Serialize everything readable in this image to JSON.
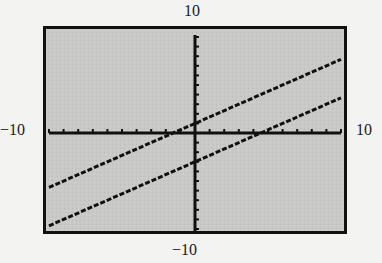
{
  "window": {
    "xmin": -10,
    "xmax": 10,
    "ymin": -10,
    "ymax": 10,
    "xscl": 1,
    "yscl": 1
  },
  "labels": {
    "top": "10",
    "bottom": "−10",
    "left": "−10",
    "right": "10"
  },
  "colors": {
    "page_background": "#f3f3f1",
    "screen_background": "#c9c9c7",
    "frame": "#111111",
    "axes": "#111111",
    "lines": "#111111"
  },
  "chart_data": {
    "type": "line",
    "title": "",
    "xlabel": "",
    "ylabel": "",
    "xlim": [
      -10,
      10
    ],
    "ylim": [
      -10,
      10
    ],
    "grid": false,
    "tick_spacing": {
      "x": 1,
      "y": 1
    },
    "window_labels": {
      "xmin": "-10",
      "xmax": "10",
      "ymin": "-10",
      "ymax": "10"
    },
    "series": [
      {
        "name": "upper line",
        "equation_estimate": "y = (2/3)x + 1",
        "x": [
          -10,
          -5,
          0,
          5,
          10
        ],
        "values": [
          -5.67,
          -2.33,
          1,
          4.33,
          7.67
        ]
      },
      {
        "name": "lower line",
        "equation_estimate": "y = (2/3)x - 3",
        "x": [
          -10,
          -5,
          0,
          5,
          10
        ],
        "values": [
          -9.67,
          -6.33,
          -3,
          0.33,
          3.67
        ]
      }
    ]
  }
}
